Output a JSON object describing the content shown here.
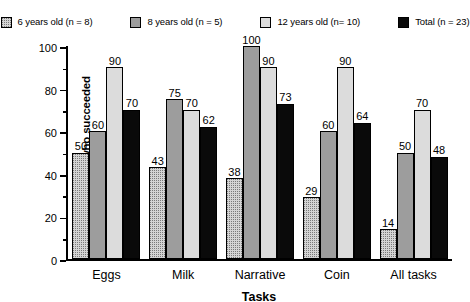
{
  "chart_data": {
    "type": "bar",
    "title": "",
    "xlabel": "Tasks",
    "ylabel": "% of children who succeeded",
    "ylim": [
      0,
      100
    ],
    "yticks": [
      0,
      20,
      40,
      60,
      80,
      100
    ],
    "ytick_labels": [
      "0",
      "20",
      "40",
      "60",
      "80",
      "100"
    ],
    "minor_ticks": [
      10,
      30,
      50,
      70,
      90
    ],
    "grid": false,
    "legend_position": "top",
    "categories": [
      "Eggs",
      "Milk",
      "Narrative",
      "Coin",
      "All tasks"
    ],
    "series": [
      {
        "name": "6 years old (n = 8)",
        "fill": "stipple",
        "color": "#d4d4d4",
        "values": [
          50,
          43,
          38,
          29,
          14
        ]
      },
      {
        "name": "8 years old (n = 5)",
        "fill": "solid-gray",
        "color": "#9d9d9d",
        "values": [
          60,
          75,
          100,
          60,
          50
        ]
      },
      {
        "name": "12 years old (n= 10)",
        "fill": "grid",
        "color": "#dcdcdc",
        "values": [
          90,
          70,
          90,
          90,
          70
        ]
      },
      {
        "name": "Total (n = 23)",
        "fill": "solid-black",
        "color": "#0a0a0a",
        "values": [
          70,
          62,
          73,
          64,
          48
        ]
      }
    ]
  },
  "legend": {
    "items": [
      {
        "label": "6 years old (n = 8)",
        "swatch": "stipple-swatch"
      },
      {
        "label": "8 years old (n = 5)",
        "swatch": "solid-gray-swatch"
      },
      {
        "label": "12 years old (n= 10)",
        "swatch": "grid-swatch"
      },
      {
        "label": "Total (n = 23)",
        "swatch": "solid-black-swatch"
      }
    ]
  }
}
